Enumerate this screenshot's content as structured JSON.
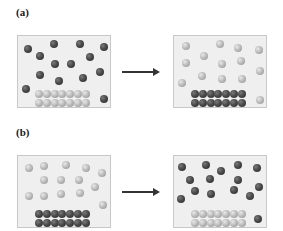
{
  "panels": [
    {
      "label": "(a)",
      "before": {
        "gas_color": "dark",
        "solid_color": "light",
        "gas_particles": [
          [
            10,
            13
          ],
          [
            36,
            8
          ],
          [
            62,
            8
          ],
          [
            86,
            11
          ],
          [
            22,
            20
          ],
          [
            72,
            21
          ],
          [
            37,
            28
          ],
          [
            53,
            28
          ],
          [
            82,
            36
          ],
          [
            22,
            39
          ],
          [
            41,
            45
          ],
          [
            65,
            42
          ],
          [
            8,
            53
          ],
          [
            86,
            63
          ]
        ],
        "lattice": {
          "rows": 2,
          "cols": 7,
          "x0": 21,
          "y0": 58,
          "dx": 7.8,
          "dy": 9
        }
      },
      "after": {
        "gas_color": "light",
        "solid_color": "dark",
        "gas_particles": [
          [
            12,
            10
          ],
          [
            46,
            8
          ],
          [
            64,
            12
          ],
          [
            85,
            14
          ],
          [
            30,
            20
          ],
          [
            12,
            27
          ],
          [
            48,
            28
          ],
          [
            67,
            25
          ],
          [
            86,
            35
          ],
          [
            28,
            40
          ],
          [
            8,
            47
          ],
          [
            48,
            43
          ],
          [
            68,
            43
          ],
          [
            86,
            64
          ]
        ],
        "lattice": {
          "rows": 2,
          "cols": 7,
          "x0": 21,
          "y0": 58,
          "dx": 7.8,
          "dy": 9
        }
      },
      "arrow": "reaction-arrow"
    },
    {
      "label": "(b)",
      "before": {
        "gas_color": "light",
        "solid_color": "dark",
        "gas_particles": [
          [
            11,
            12
          ],
          [
            26,
            10
          ],
          [
            48,
            9
          ],
          [
            68,
            12
          ],
          [
            84,
            17
          ],
          [
            26,
            24
          ],
          [
            43,
            24
          ],
          [
            61,
            24
          ],
          [
            77,
            31
          ],
          [
            11,
            40
          ],
          [
            26,
            40
          ],
          [
            43,
            38
          ],
          [
            62,
            37
          ],
          [
            85,
            49
          ]
        ],
        "lattice": {
          "rows": 2,
          "cols": 7,
          "x0": 21,
          "y0": 58,
          "dx": 7.8,
          "dy": 9
        }
      },
      "after": {
        "gas_color": "dark",
        "solid_color": "light",
        "gas_particles": [
          [
            8,
            11
          ],
          [
            32,
            9
          ],
          [
            47,
            15
          ],
          [
            64,
            9
          ],
          [
            83,
            12
          ],
          [
            16,
            24
          ],
          [
            36,
            23
          ],
          [
            64,
            24
          ],
          [
            85,
            31
          ],
          [
            21,
            35
          ],
          [
            37,
            38
          ],
          [
            60,
            34
          ],
          [
            76,
            40
          ],
          [
            7,
            43
          ],
          [
            84,
            63
          ]
        ],
        "lattice": {
          "rows": 2,
          "cols": 7,
          "x0": 21,
          "y0": 58,
          "dx": 7.8,
          "dy": 9
        }
      },
      "arrow": "reaction-arrow"
    }
  ],
  "colors": {
    "dark_sphere": "#3a3a3a",
    "light_sphere": "#bdbdbd",
    "box_fill": "#efefef",
    "box_border": "#c8c8c8",
    "arrow": "#333333"
  }
}
